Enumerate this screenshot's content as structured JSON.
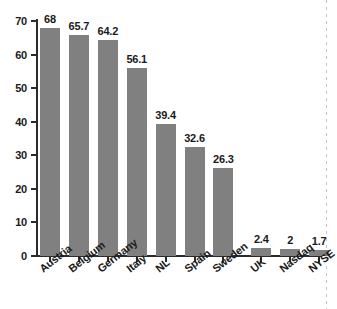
{
  "chart_data": {
    "type": "bar",
    "title": "",
    "subtitle": "",
    "xlabel": "",
    "ylabel": "",
    "categories": [
      "Austria",
      "Belgium",
      "Germany",
      "Italy",
      "NL",
      "Spain",
      "Sweden",
      "UK",
      "Nasdaq",
      "NYSE"
    ],
    "values": [
      68,
      65.7,
      64.2,
      56.1,
      39.4,
      32.6,
      26.3,
      2.4,
      2,
      1.7
    ],
    "value_labels": [
      "68",
      "65.7",
      "64.2",
      "56.1",
      "39.4",
      "32.6",
      "26.3",
      "2.4",
      "2",
      "1.7"
    ],
    "ylim": [
      0,
      70
    ],
    "yticks": [
      0,
      10,
      20,
      30,
      40,
      50,
      60,
      70
    ],
    "ytick_labels": [
      "0",
      "10",
      "20",
      "30",
      "40",
      "50",
      "60",
      "70"
    ],
    "grid": false,
    "legend": null,
    "legend_position": "none",
    "series": [
      {
        "name": "",
        "values": [
          68,
          65.7,
          64.2,
          56.1,
          39.4,
          32.6,
          26.3,
          2.4,
          2,
          1.7
        ]
      }
    ],
    "bar_color": "#808080",
    "axis_color": "#2b2b2b",
    "text_color": "#1a1a1a",
    "background_color": "#ffffff",
    "group_break_after_index": 6,
    "category_label_rotation_deg": -38
  }
}
